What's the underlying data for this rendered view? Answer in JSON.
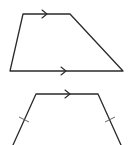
{
  "figures": [
    {
      "id": "trapezoid-1",
      "description": "Trapezoid with one pair of parallel sides (top and bottom) marked with arrows",
      "parallel_marks": [
        "top",
        "bottom"
      ],
      "congruent_marks": []
    },
    {
      "id": "trapezoid-2",
      "description": "Isosceles trapezoid with top side marked parallel and congruent legs marked with tick marks",
      "parallel_marks": [
        "top"
      ],
      "congruent_marks": [
        "left-leg",
        "right-leg"
      ]
    }
  ],
  "colors": {
    "stroke": "#2a2a2a",
    "background": "#ffffff"
  }
}
